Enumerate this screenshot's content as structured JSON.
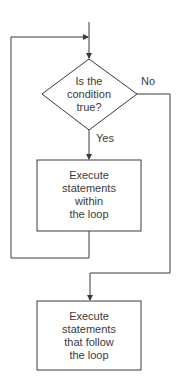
{
  "diagram": {
    "type": "flowchart",
    "colors": {
      "line": "#3a3a3a",
      "text": "#3a3a3a",
      "background": "#ffffff"
    },
    "nodes": [
      {
        "id": "decision",
        "shape": "diamond",
        "lines": [
          "Is the",
          "condition",
          "true?"
        ]
      },
      {
        "id": "loop-body",
        "shape": "rectangle",
        "lines": [
          "Execute",
          "statements",
          "within",
          "the loop"
        ]
      },
      {
        "id": "after-loop",
        "shape": "rectangle",
        "lines": [
          "Execute",
          "statements",
          "that follow",
          "the loop"
        ]
      }
    ],
    "edges": [
      {
        "from": "entry",
        "to": "decision",
        "label": ""
      },
      {
        "from": "decision",
        "to": "loop-body",
        "label": "Yes"
      },
      {
        "from": "decision",
        "to": "after-loop",
        "label": "No"
      },
      {
        "from": "loop-body",
        "to": "decision",
        "label": ""
      }
    ],
    "labels": {
      "yes": "Yes",
      "no": "No"
    }
  }
}
